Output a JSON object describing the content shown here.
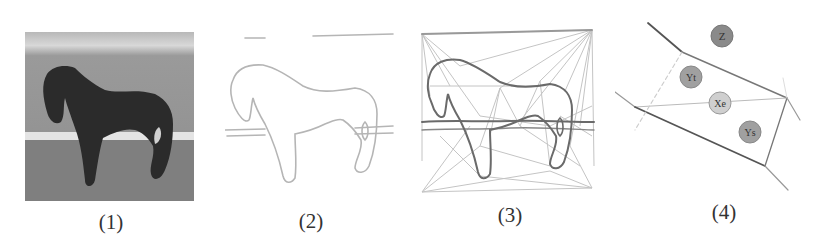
{
  "figure": {
    "panels": [
      {
        "id": 1,
        "caption": "(1)",
        "content": "grayscale photo of a dark horse standing on grass with a white fence rail behind"
      },
      {
        "id": 2,
        "caption": "(2)",
        "content": "extracted horse contour / edge map"
      },
      {
        "id": 3,
        "caption": "(3)",
        "content": "constrained Delaunay triangulation over horse contour and bounding box"
      },
      {
        "id": 4,
        "caption": "(4)",
        "content": "local triangulation cell with labeled nodes"
      }
    ],
    "nodes": [
      {
        "label": "Z",
        "shade": "#8a8a8a"
      },
      {
        "label": "Yt",
        "shade": "#a0a0a0"
      },
      {
        "label": "Xe",
        "shade": "#cfcfcf"
      },
      {
        "label": "Ys",
        "shade": "#a0a0a0"
      }
    ],
    "colors": {
      "background": "#ffffff",
      "photo_grass": "#8e8e8e",
      "horse": "#2a2a2a",
      "contour_light": "#b5b5b5",
      "contour_dark": "#6a6a6a",
      "triangulation_line": "#c4c4c4"
    }
  }
}
